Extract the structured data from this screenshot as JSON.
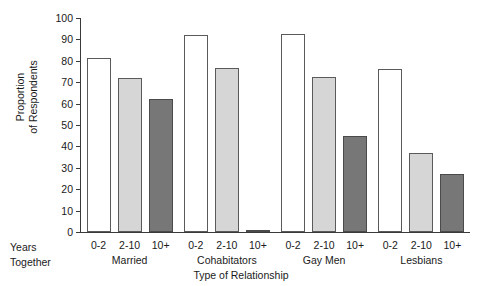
{
  "chart_data": {
    "type": "bar",
    "title": "",
    "xlabel": "Type of Relationship",
    "ylabel": "Proportion\nof Respondents",
    "ylim": [
      0,
      100
    ],
    "yticks": [
      0,
      10,
      20,
      30,
      40,
      50,
      60,
      70,
      80,
      90,
      100
    ],
    "grid": false,
    "legend": "none",
    "row_label": "Years\nTogether",
    "categories": [
      "Married",
      "Cohabitators",
      "Gay Men",
      "Lesbians"
    ],
    "subcategories": [
      "0-2",
      "2-10",
      "10+"
    ],
    "series": [
      {
        "name": "0-2",
        "values": [
          81.5,
          92.0,
          92.5,
          76.0
        ]
      },
      {
        "name": "2-10",
        "values": [
          72.0,
          76.5,
          72.5,
          37.0
        ]
      },
      {
        "name": "10+",
        "values": [
          62.0,
          1.0,
          45.0,
          27.0
        ]
      }
    ],
    "bars": [
      {
        "group": "Married",
        "sub": "0-2",
        "value": 81.5,
        "fill": "white"
      },
      {
        "group": "Married",
        "sub": "2-10",
        "value": 72.0,
        "fill": "light"
      },
      {
        "group": "Married",
        "sub": "10+",
        "value": 62.0,
        "fill": "dark"
      },
      {
        "group": "Cohabitators",
        "sub": "0-2",
        "value": 92.0,
        "fill": "white"
      },
      {
        "group": "Cohabitators",
        "sub": "2-10",
        "value": 76.5,
        "fill": "light"
      },
      {
        "group": "Cohabitators",
        "sub": "10+",
        "value": 1.0,
        "fill": "dark"
      },
      {
        "group": "Gay Men",
        "sub": "0-2",
        "value": 92.5,
        "fill": "white"
      },
      {
        "group": "Gay Men",
        "sub": "2-10",
        "value": 72.5,
        "fill": "light"
      },
      {
        "group": "Gay Men",
        "sub": "10+",
        "value": 45.0,
        "fill": "dark"
      },
      {
        "group": "Lesbians",
        "sub": "0-2",
        "value": 76.0,
        "fill": "white"
      },
      {
        "group": "Lesbians",
        "sub": "2-10",
        "value": 37.0,
        "fill": "light"
      },
      {
        "group": "Lesbians",
        "sub": "10+",
        "value": 27.0,
        "fill": "dark"
      }
    ],
    "colors": {
      "bar_white": "#ffffff",
      "bar_light": "#d6d6d6",
      "bar_dark": "#777777",
      "bar_outline": "#5a5a5a",
      "axis": "#3a3a3a",
      "text": "#1a1a1a",
      "background": "#ffffff"
    }
  }
}
